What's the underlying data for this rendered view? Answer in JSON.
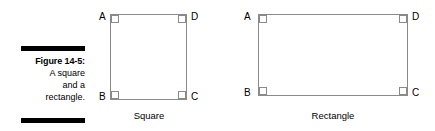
{
  "figure": {
    "caption": {
      "label": "Figure 14-5:",
      "lines": [
        "A square",
        "and a",
        "rectangle."
      ]
    },
    "rules": {
      "top": "top-rule",
      "bottom": "bottom-rule"
    }
  },
  "shapes": [
    {
      "id": "square",
      "name": "Square",
      "caption": "Square",
      "vertices": {
        "top_left": "A",
        "top_right": "D",
        "bottom_left": "B",
        "bottom_right": "C"
      },
      "right_angle_markers": 4
    },
    {
      "id": "rectangle",
      "name": "Rectangle",
      "caption": "Rectangle",
      "vertices": {
        "top_left": "A",
        "top_right": "D",
        "bottom_left": "B",
        "bottom_right": "C"
      },
      "right_angle_markers": 4
    }
  ],
  "colors": {
    "background": "#ffffff",
    "text": "#000000",
    "shape_stroke": "#8a8a8a",
    "rule": "#000000"
  }
}
